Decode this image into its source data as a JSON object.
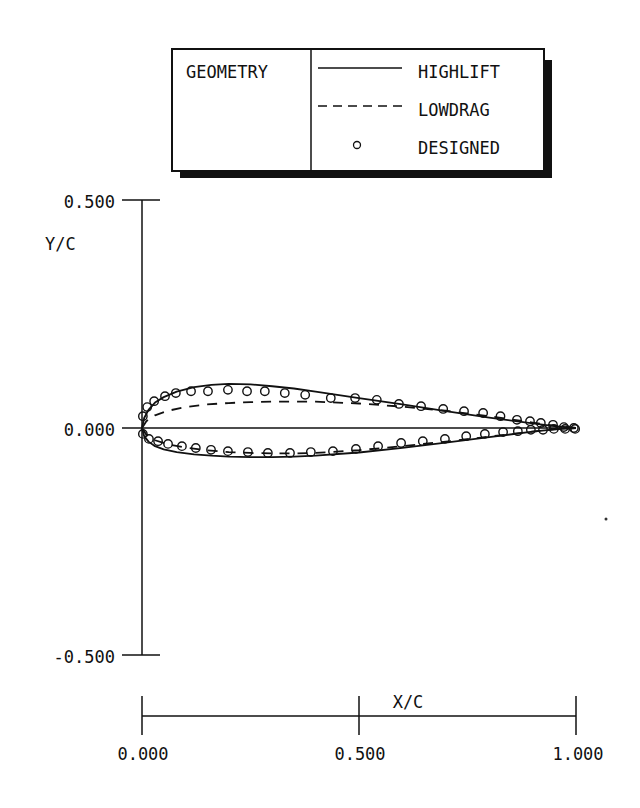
{
  "chart_data": {
    "type": "line",
    "title": "",
    "xlabel": "X/C",
    "ylabel": "Y/C",
    "xlim": [
      0.0,
      1.0
    ],
    "ylim": [
      -0.5,
      0.5
    ],
    "x_ticks": [
      "0.000",
      "0.500",
      "1.000"
    ],
    "y_ticks": [
      "0.500",
      "0.000",
      "-0.500"
    ],
    "grid": false,
    "legend": {
      "title": "GEOMETRY",
      "position": "top",
      "entries": [
        {
          "label": "HIGHLIFT",
          "style": "solid"
        },
        {
          "label": "LOWDRAG",
          "style": "dashed"
        },
        {
          "label": "DESIGNED",
          "style": "circle-markers"
        }
      ]
    },
    "series": [
      {
        "name": "HIGHLIFT",
        "style": "solid",
        "upper": {
          "x": [
            0.0,
            0.005,
            0.015,
            0.03,
            0.05,
            0.08,
            0.12,
            0.16,
            0.2,
            0.25,
            0.3,
            0.35,
            0.4,
            0.5,
            0.6,
            0.7,
            0.8,
            0.9,
            0.95,
            1.0
          ],
          "y": [
            0.0,
            0.022,
            0.04,
            0.056,
            0.068,
            0.08,
            0.09,
            0.095,
            0.097,
            0.096,
            0.092,
            0.087,
            0.08,
            0.066,
            0.052,
            0.037,
            0.023,
            0.01,
            0.004,
            0.0
          ]
        },
        "lower": {
          "x": [
            0.0,
            0.005,
            0.015,
            0.03,
            0.05,
            0.08,
            0.12,
            0.16,
            0.2,
            0.25,
            0.3,
            0.35,
            0.4,
            0.5,
            0.6,
            0.7,
            0.8,
            0.9,
            0.95,
            1.0
          ],
          "y": [
            0.0,
            -0.018,
            -0.03,
            -0.04,
            -0.047,
            -0.053,
            -0.058,
            -0.061,
            -0.063,
            -0.064,
            -0.064,
            -0.063,
            -0.061,
            -0.054,
            -0.044,
            -0.032,
            -0.02,
            -0.008,
            -0.003,
            0.0
          ]
        }
      },
      {
        "name": "LOWDRAG",
        "style": "dashed",
        "upper": {
          "x": [
            0.0,
            0.01,
            0.03,
            0.06,
            0.1,
            0.15,
            0.2,
            0.25,
            0.3,
            0.35,
            0.4,
            0.5,
            0.6,
            0.7,
            0.8,
            0.9,
            0.95,
            1.0
          ],
          "y": [
            0.0,
            0.015,
            0.028,
            0.038,
            0.046,
            0.052,
            0.055,
            0.057,
            0.058,
            0.058,
            0.058,
            0.054,
            0.047,
            0.038,
            0.026,
            0.012,
            0.005,
            0.0
          ]
        },
        "lower": {
          "x": [
            0.0,
            0.01,
            0.03,
            0.06,
            0.1,
            0.15,
            0.2,
            0.25,
            0.3,
            0.35,
            0.4,
            0.5,
            0.6,
            0.7,
            0.8,
            0.9,
            0.95,
            1.0
          ],
          "y": [
            0.0,
            -0.015,
            -0.027,
            -0.036,
            -0.043,
            -0.049,
            -0.053,
            -0.055,
            -0.056,
            -0.056,
            -0.055,
            -0.049,
            -0.04,
            -0.03,
            -0.019,
            -0.008,
            -0.003,
            0.0
          ]
        }
      },
      {
        "name": "DESIGNED",
        "style": "circles",
        "upper": {
          "x": [
            0.002,
            0.012,
            0.028,
            0.053,
            0.078,
            0.113,
            0.152,
            0.198,
            0.242,
            0.283,
            0.329,
            0.376,
            0.435,
            0.491,
            0.541,
            0.592,
            0.643,
            0.694,
            0.742,
            0.786,
            0.826,
            0.864,
            0.894,
            0.919,
            0.947,
            0.972,
            0.995
          ],
          "y": [
            0.026,
            0.046,
            0.059,
            0.07,
            0.077,
            0.081,
            0.081,
            0.084,
            0.081,
            0.081,
            0.077,
            0.073,
            0.066,
            0.066,
            0.062,
            0.053,
            0.048,
            0.042,
            0.037,
            0.033,
            0.026,
            0.018,
            0.015,
            0.011,
            0.007,
            0.002,
            0.0
          ]
        },
        "lower": {
          "x": [
            0.002,
            0.016,
            0.037,
            0.06,
            0.092,
            0.124,
            0.159,
            0.198,
            0.244,
            0.29,
            0.341,
            0.389,
            0.44,
            0.493,
            0.544,
            0.597,
            0.647,
            0.698,
            0.747,
            0.79,
            0.832,
            0.866,
            0.896,
            0.924,
            0.949,
            0.975,
            0.998
          ],
          "y": [
            -0.013,
            -0.024,
            -0.029,
            -0.035,
            -0.04,
            -0.044,
            -0.048,
            -0.051,
            -0.053,
            -0.055,
            -0.055,
            -0.053,
            -0.051,
            -0.046,
            -0.04,
            -0.033,
            -0.029,
            -0.024,
            -0.018,
            -0.013,
            -0.009,
            -0.007,
            -0.004,
            -0.004,
            -0.002,
            -0.002,
            -0.002
          ]
        }
      }
    ]
  }
}
